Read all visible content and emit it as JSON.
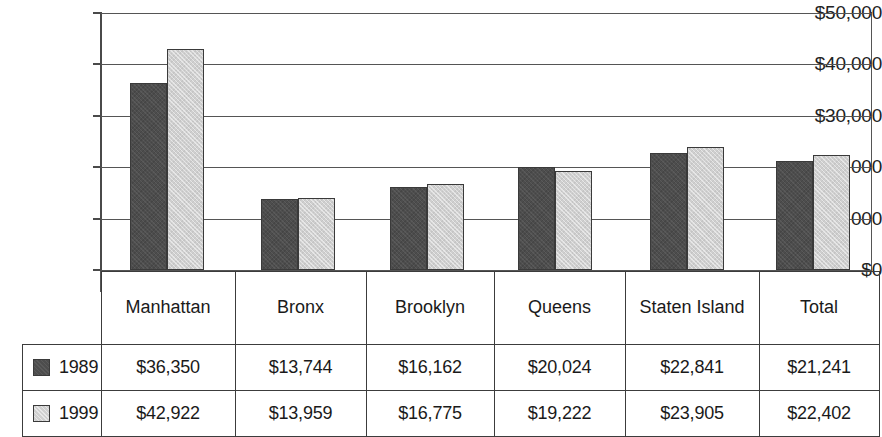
{
  "chart_data": {
    "type": "bar",
    "title": "",
    "xlabel": "",
    "ylabel": "",
    "ylim": [
      0,
      50000
    ],
    "grid": true,
    "legend_position": "table-left",
    "categories": [
      "Manhattan",
      "Bronx",
      "Brooklyn",
      "Queens",
      "Staten Island",
      "Total"
    ],
    "y_ticks": [
      {
        "value": 50000,
        "label": "$50,000"
      },
      {
        "value": 40000,
        "label": "$40,000"
      },
      {
        "value": 30000,
        "label": "$30,000"
      },
      {
        "value": 20000,
        "label": "$20,000"
      },
      {
        "value": 10000,
        "label": "$10,000"
      },
      {
        "value": 0,
        "label": "$0"
      }
    ],
    "series": [
      {
        "name": "1989",
        "color": "#4d4d4d",
        "values": [
          36350,
          13744,
          16162,
          20024,
          22841,
          21241
        ],
        "labels": [
          "$36,350",
          "$13,744",
          "$16,162",
          "$20,024",
          "$22,841",
          "$21,241"
        ]
      },
      {
        "name": "1999",
        "color": "#cfcfcf",
        "values": [
          42922,
          13959,
          16775,
          19222,
          23905,
          22402
        ],
        "labels": [
          "$42,922",
          "$13,959",
          "$16,775",
          "$19,222",
          "$23,905",
          "$22,402"
        ]
      }
    ]
  }
}
